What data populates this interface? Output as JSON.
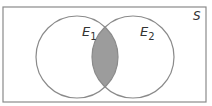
{
  "diagram": {
    "type": "venn",
    "universe_label": "S",
    "sets": [
      {
        "label": "E",
        "subscript": "1"
      },
      {
        "label": "E",
        "subscript": "2"
      }
    ],
    "shaded_region": "intersection",
    "colors": {
      "border": "#8a8a8a",
      "shade": "#9c9c9c",
      "text": "#333333"
    }
  }
}
